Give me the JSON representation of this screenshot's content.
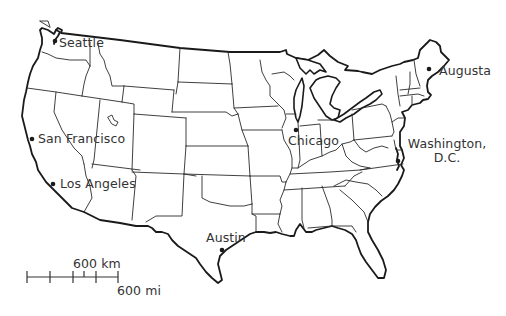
{
  "map": {
    "title": "Contiguous United States",
    "cities": [
      {
        "name": "Seattle",
        "x": 55,
        "y": 40,
        "label_x": 59,
        "label_y": 37
      },
      {
        "name": "San Francisco",
        "x": 32,
        "y": 140,
        "label_x": 38,
        "label_y": 133
      },
      {
        "name": "Los Angeles",
        "x": 52,
        "y": 184,
        "label_x": 60,
        "label_y": 177
      },
      {
        "name": "Chicago",
        "x": 296,
        "y": 130,
        "label_x": 288,
        "label_y": 135
      },
      {
        "name": "Austin",
        "x": 222,
        "y": 250,
        "label_x": 206,
        "label_y": 232
      },
      {
        "name": "Augusta",
        "x": 429,
        "y": 69,
        "label_x": 439,
        "label_y": 65
      },
      {
        "name": "Washington, D.C.",
        "line1": "Washington,",
        "line2": "D.C.",
        "x": 398,
        "y": 160,
        "label_x": 406,
        "label_y": 137
      }
    ],
    "scale": {
      "km_label": "600 km",
      "mi_label": "600 mi"
    }
  }
}
